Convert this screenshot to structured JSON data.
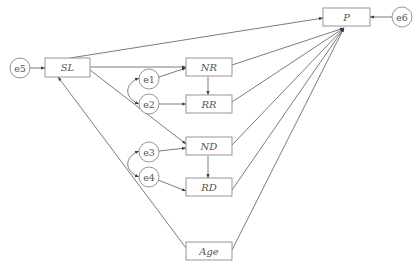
{
  "diagram": {
    "type": "path-diagram",
    "observed_variables": [
      {
        "id": "P",
        "label": "P"
      },
      {
        "id": "SL",
        "label": "SL"
      },
      {
        "id": "NR",
        "label": "NR"
      },
      {
        "id": "RR",
        "label": "RR"
      },
      {
        "id": "ND",
        "label": "ND"
      },
      {
        "id": "RD",
        "label": "RD"
      },
      {
        "id": "Age",
        "label": "Age"
      }
    ],
    "error_terms": [
      {
        "id": "e1",
        "label": "e1"
      },
      {
        "id": "e2",
        "label": "e2"
      },
      {
        "id": "e3",
        "label": "e3"
      },
      {
        "id": "e4",
        "label": "e4"
      },
      {
        "id": "e5",
        "label": "e5"
      },
      {
        "id": "e6",
        "label": "e6"
      }
    ],
    "paths": [
      {
        "from": "e5",
        "to": "SL"
      },
      {
        "from": "e6",
        "to": "P"
      },
      {
        "from": "e1",
        "to": "NR"
      },
      {
        "from": "e2",
        "to": "RR"
      },
      {
        "from": "e3",
        "to": "ND"
      },
      {
        "from": "e4",
        "to": "RD"
      },
      {
        "from": "SL",
        "to": "P"
      },
      {
        "from": "SL",
        "to": "NR"
      },
      {
        "from": "SL",
        "to": "ND"
      },
      {
        "from": "NR",
        "to": "RR"
      },
      {
        "from": "ND",
        "to": "RD"
      },
      {
        "from": "NR",
        "to": "P"
      },
      {
        "from": "RR",
        "to": "P"
      },
      {
        "from": "ND",
        "to": "P"
      },
      {
        "from": "RD",
        "to": "P"
      },
      {
        "from": "Age",
        "to": "P"
      },
      {
        "from": "Age",
        "to": "SL"
      }
    ],
    "covariances": [
      {
        "between": [
          "e1",
          "e2"
        ]
      },
      {
        "between": [
          "e3",
          "e4"
        ]
      }
    ]
  }
}
